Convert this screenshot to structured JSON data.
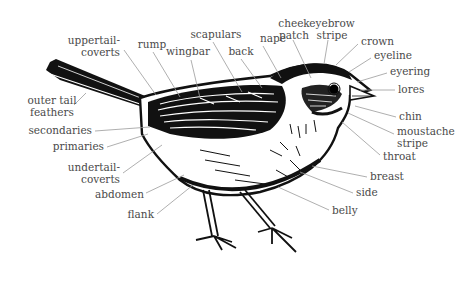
{
  "diagram": {
    "labels": [
      {
        "id": "uppertail-coverts",
        "lines": [
          "uppertail-",
          "coverts"
        ],
        "x": 120,
        "y": 44,
        "anchor": "end",
        "lx1": 124,
        "ly1": 50,
        "lx2": 156,
        "ly2": 95
      },
      {
        "id": "rump",
        "lines": [
          "rump"
        ],
        "x": 152,
        "y": 48,
        "anchor": "middle",
        "lx1": 153,
        "ly1": 52,
        "lx2": 180,
        "ly2": 97
      },
      {
        "id": "wingbar",
        "lines": [
          "wingbar"
        ],
        "x": 188,
        "y": 55,
        "anchor": "middle",
        "lx1": 191,
        "ly1": 60,
        "lx2": 200,
        "ly2": 98
      },
      {
        "id": "scapulars",
        "lines": [
          "scapulars"
        ],
        "x": 216,
        "y": 38,
        "anchor": "middle",
        "lx1": 213,
        "ly1": 42,
        "lx2": 242,
        "ly2": 92
      },
      {
        "id": "back",
        "lines": [
          "back"
        ],
        "x": 241,
        "y": 55,
        "anchor": "middle",
        "lx1": 241,
        "ly1": 59,
        "lx2": 262,
        "ly2": 88
      },
      {
        "id": "nape",
        "lines": [
          "nape"
        ],
        "x": 273,
        "y": 42,
        "anchor": "middle",
        "lx1": 263,
        "ly1": 46,
        "lx2": 281,
        "ly2": 78
      },
      {
        "id": "cheek-patch",
        "lines": [
          "cheek",
          "patch"
        ],
        "x": 294,
        "y": 27,
        "anchor": "middle",
        "lx1": 293,
        "ly1": 40,
        "lx2": 311,
        "ly2": 78
      },
      {
        "id": "eyebrow-stripe",
        "lines": [
          "eyebrow",
          "stripe"
        ],
        "x": 332,
        "y": 27,
        "anchor": "middle",
        "lx1": 328,
        "ly1": 40,
        "lx2": 324,
        "ly2": 64
      },
      {
        "id": "crown",
        "lines": [
          "crown"
        ],
        "x": 361,
        "y": 45,
        "anchor": "start",
        "lx1": 358,
        "ly1": 44,
        "lx2": 336,
        "ly2": 65
      },
      {
        "id": "eyeline",
        "lines": [
          "eyeline"
        ],
        "x": 374,
        "y": 59,
        "anchor": "start",
        "lx1": 371,
        "ly1": 58,
        "lx2": 349,
        "ly2": 72
      },
      {
        "id": "eyering",
        "lines": [
          "eyering"
        ],
        "x": 390,
        "y": 75,
        "anchor": "start",
        "lx1": 387,
        "ly1": 73,
        "lx2": 357,
        "ly2": 82
      },
      {
        "id": "lores",
        "lines": [
          "lores"
        ],
        "x": 398,
        "y": 93,
        "anchor": "start",
        "lx1": 395,
        "ly1": 90,
        "lx2": 360,
        "ly2": 90
      },
      {
        "id": "chin",
        "lines": [
          "chin"
        ],
        "x": 399,
        "y": 120,
        "anchor": "start",
        "lx1": 396,
        "ly1": 117,
        "lx2": 355,
        "ly2": 106
      },
      {
        "id": "moustache-stripe",
        "lines": [
          "moustache",
          "stripe"
        ],
        "x": 397,
        "y": 135,
        "anchor": "start",
        "lx1": 394,
        "ly1": 134,
        "lx2": 348,
        "ly2": 113
      },
      {
        "id": "throat",
        "lines": [
          "throat"
        ],
        "x": 383,
        "y": 160,
        "anchor": "start",
        "lx1": 380,
        "ly1": 155,
        "lx2": 342,
        "ly2": 122
      },
      {
        "id": "breast",
        "lines": [
          "breast"
        ],
        "x": 370,
        "y": 180,
        "anchor": "start",
        "lx1": 367,
        "ly1": 177,
        "lx2": 312,
        "ly2": 166
      },
      {
        "id": "side",
        "lines": [
          "side"
        ],
        "x": 356,
        "y": 196,
        "anchor": "start",
        "lx1": 353,
        "ly1": 193,
        "lx2": 300,
        "ly2": 172
      },
      {
        "id": "belly",
        "lines": [
          "belly"
        ],
        "x": 332,
        "y": 214,
        "anchor": "start",
        "lx1": 329,
        "ly1": 210,
        "lx2": 278,
        "ly2": 187
      },
      {
        "id": "outer-tail-feathers",
        "lines": [
          "outer tail",
          "feathers"
        ],
        "x": 52,
        "y": 104,
        "anchor": "middle",
        "lx1": 74,
        "ly1": 105,
        "lx2": 86,
        "ly2": 93
      },
      {
        "id": "secondaries",
        "lines": [
          "secondaries"
        ],
        "x": 92,
        "y": 134,
        "anchor": "end",
        "lx1": 95,
        "ly1": 131,
        "lx2": 150,
        "ly2": 127
      },
      {
        "id": "primaries",
        "lines": [
          "primaries"
        ],
        "x": 104,
        "y": 150,
        "anchor": "end",
        "lx1": 107,
        "ly1": 147,
        "lx2": 148,
        "ly2": 134
      },
      {
        "id": "undertail-coverts",
        "lines": [
          "undertail-",
          "coverts"
        ],
        "x": 120,
        "y": 171,
        "anchor": "end",
        "lx1": 123,
        "ly1": 173,
        "lx2": 162,
        "ly2": 145
      },
      {
        "id": "abdomen",
        "lines": [
          "abdomen"
        ],
        "x": 144,
        "y": 198,
        "anchor": "end",
        "lx1": 146,
        "ly1": 193,
        "lx2": 184,
        "ly2": 175
      },
      {
        "id": "flank",
        "lines": [
          "flank"
        ],
        "x": 154,
        "y": 218,
        "anchor": "end",
        "lx1": 157,
        "ly1": 214,
        "lx2": 193,
        "ly2": 185
      }
    ]
  },
  "colors": {
    "ink": "#111111",
    "label": "#4a4a4a",
    "leader": "#9a9a9a",
    "background": "#ffffff"
  }
}
